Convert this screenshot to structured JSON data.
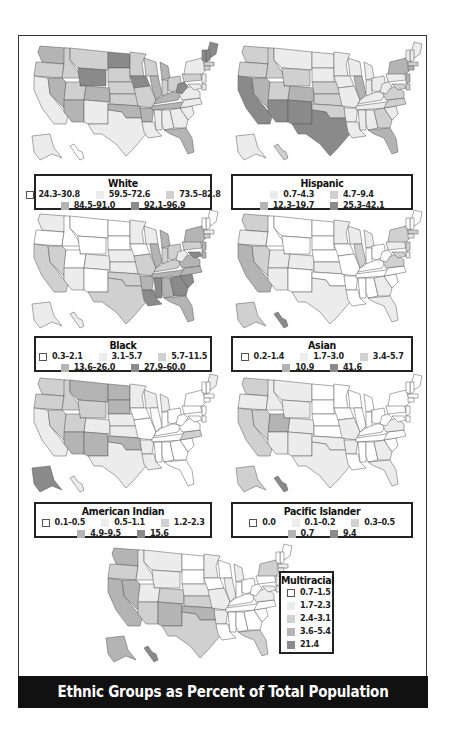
{
  "title": "Ethnic Groups as Percent of Total Population",
  "colors": {
    "c0": "#ffffff",
    "c1": "#ececec",
    "c2": "#d0d0d0",
    "c3": "#b4b4b4",
    "c4": "#8a8a8a",
    "border": "#555555"
  },
  "maps": [
    {
      "id": "white",
      "title": "White",
      "legend": [
        {
          "label": "24.3–30.8",
          "level": 0
        },
        {
          "label": "59.5–72.6",
          "level": 1
        },
        {
          "label": "73.5–82.8",
          "level": 2
        },
        {
          "label": "84.5–91.0",
          "level": 3
        },
        {
          "label": "92.1–96.9",
          "level": 4
        }
      ]
    },
    {
      "id": "hispanic",
      "title": "Hispanic",
      "legend": [
        {
          "label": "0.7–4.3",
          "level": 1
        },
        {
          "label": "4.7–9.4",
          "level": 2
        },
        {
          "label": "12.3–19.7",
          "level": 3
        },
        {
          "label": "25.3–42.1",
          "level": 4
        }
      ]
    },
    {
      "id": "black",
      "title": "Black",
      "legend": [
        {
          "label": "0.3–2.1",
          "level": 0
        },
        {
          "label": "3.1–5.7",
          "level": 1
        },
        {
          "label": "5.7–11.5",
          "level": 2
        },
        {
          "label": "13.6–26.0",
          "level": 3
        },
        {
          "label": "27.9–60.0",
          "level": 4
        }
      ]
    },
    {
      "id": "asian",
      "title": "Asian",
      "legend": [
        {
          "label": "0.2–1.4",
          "level": 0
        },
        {
          "label": "1.7–3.0",
          "level": 1
        },
        {
          "label": "3.4–5.7",
          "level": 2
        },
        {
          "label": "10.9",
          "level": 3
        },
        {
          "label": "41.6",
          "level": 4
        }
      ]
    },
    {
      "id": "american-indian",
      "title": "American Indian",
      "legend": [
        {
          "label": "0.1–0.5",
          "level": 0
        },
        {
          "label": "0.5–1.1",
          "level": 1
        },
        {
          "label": "1.2–2.3",
          "level": 2
        },
        {
          "label": "4.9–9.5",
          "level": 3
        },
        {
          "label": "15.6",
          "level": 4
        }
      ]
    },
    {
      "id": "pacific-islander",
      "title": "Pacific Islander",
      "legend": [
        {
          "label": "0.0",
          "level": 0
        },
        {
          "label": "0.1–0.2",
          "level": 1
        },
        {
          "label": "0.3–0.5",
          "level": 2
        },
        {
          "label": "0.7",
          "level": 3
        },
        {
          "label": "9.4",
          "level": 4
        }
      ]
    },
    {
      "id": "multiracial",
      "title": "Multiracial",
      "legend": [
        {
          "label": "0.7–1.5",
          "level": 0
        },
        {
          "label": "1.7–2.3",
          "level": 1
        },
        {
          "label": "2.4–3.1",
          "level": 2
        },
        {
          "label": "3.6–5.4",
          "level": 3
        },
        {
          "label": "21.4",
          "level": 4
        }
      ]
    }
  ],
  "shading": {
    "white": {
      "WA": 3,
      "OR": 2,
      "CA": 1,
      "NV": 3,
      "ID": 2,
      "MT": 2,
      "WY": 4,
      "UT": 2,
      "AZ": 3,
      "CO": 3,
      "NM": 1,
      "ND": 4,
      "SD": 2,
      "NE": 2,
      "KS": 2,
      "OK": 3,
      "TX": 1,
      "MN": 2,
      "IA": 4,
      "MO": 2,
      "AR": 3,
      "LA": 1,
      "WI": 2,
      "IL": 3,
      "MI": 3,
      "IN": 2,
      "OH": 2,
      "KY": 3,
      "TN": 3,
      "MS": 1,
      "AL": 1,
      "GA": 1,
      "FL": 3,
      "SC": 1,
      "NC": 1,
      "VA": 1,
      "WV": 4,
      "PA": 2,
      "NY": 1,
      "ME": 4,
      "NH": 4,
      "VT": 4,
      "MA": 2,
      "CT": 2,
      "NJ": 1,
      "MD": 1,
      "DE": 1,
      "AK": 1,
      "HI": 0
    },
    "hispanic": {
      "WA": 2,
      "OR": 2,
      "CA": 4,
      "NV": 3,
      "ID": 2,
      "MT": 1,
      "WY": 2,
      "UT": 2,
      "AZ": 4,
      "CO": 3,
      "NM": 4,
      "ND": 1,
      "SD": 1,
      "NE": 2,
      "KS": 2,
      "OK": 2,
      "TX": 4,
      "MN": 1,
      "IA": 1,
      "MO": 1,
      "AR": 1,
      "LA": 1,
      "WI": 1,
      "IL": 3,
      "MI": 1,
      "IN": 1,
      "OH": 1,
      "KY": 1,
      "TN": 1,
      "MS": 1,
      "AL": 1,
      "GA": 2,
      "FL": 3,
      "SC": 1,
      "NC": 2,
      "VA": 2,
      "WV": 1,
      "PA": 1,
      "NY": 3,
      "ME": 1,
      "NH": 1,
      "VT": 1,
      "MA": 2,
      "CT": 3,
      "NJ": 3,
      "MD": 2,
      "DE": 2,
      "AK": 1,
      "HI": 2
    },
    "black": {
      "WA": 1,
      "OR": 0,
      "CA": 2,
      "NV": 2,
      "ID": 0,
      "MT": 0,
      "WY": 0,
      "UT": 0,
      "AZ": 1,
      "CO": 1,
      "NM": 0,
      "ND": 0,
      "SD": 0,
      "NE": 1,
      "KS": 1,
      "OK": 2,
      "TX": 2,
      "MN": 1,
      "IA": 0,
      "MO": 2,
      "AR": 3,
      "LA": 4,
      "WI": 1,
      "IL": 3,
      "MI": 3,
      "IN": 2,
      "OH": 2,
      "KY": 2,
      "TN": 3,
      "MS": 4,
      "AL": 3,
      "GA": 4,
      "FL": 3,
      "SC": 4,
      "NC": 3,
      "VA": 3,
      "WV": 1,
      "PA": 2,
      "NY": 3,
      "ME": 0,
      "NH": 0,
      "VT": 0,
      "MA": 1,
      "CT": 2,
      "NJ": 3,
      "MD": 4,
      "DE": 3,
      "AK": 1,
      "HI": 1
    },
    "asian": {
      "WA": 2,
      "OR": 1,
      "CA": 3,
      "NV": 2,
      "ID": 0,
      "MT": 0,
      "WY": 0,
      "UT": 1,
      "AZ": 1,
      "CO": 1,
      "NM": 0,
      "ND": 0,
      "SD": 0,
      "NE": 0,
      "KS": 1,
      "OK": 0,
      "TX": 1,
      "MN": 1,
      "IA": 0,
      "MO": 0,
      "AR": 0,
      "LA": 0,
      "WI": 1,
      "IL": 2,
      "MI": 1,
      "IN": 0,
      "OH": 0,
      "KY": 0,
      "TN": 0,
      "MS": 0,
      "AL": 0,
      "GA": 1,
      "FL": 1,
      "SC": 0,
      "NC": 0,
      "VA": 2,
      "WV": 0,
      "PA": 1,
      "NY": 2,
      "ME": 0,
      "NH": 0,
      "VT": 0,
      "MA": 2,
      "CT": 1,
      "NJ": 2,
      "MD": 2,
      "DE": 1,
      "AK": 2,
      "HI": 4
    },
    "american-indian": {
      "WA": 2,
      "OR": 2,
      "CA": 1,
      "NV": 2,
      "ID": 2,
      "MT": 3,
      "WY": 2,
      "UT": 2,
      "AZ": 3,
      "CO": 1,
      "NM": 3,
      "ND": 3,
      "SD": 3,
      "NE": 1,
      "KS": 1,
      "OK": 3,
      "TX": 1,
      "MN": 1,
      "IA": 0,
      "MO": 0,
      "AR": 1,
      "LA": 1,
      "WI": 1,
      "IL": 0,
      "MI": 1,
      "IN": 0,
      "OH": 0,
      "KY": 0,
      "TN": 0,
      "MS": 0,
      "AL": 0,
      "GA": 0,
      "FL": 0,
      "SC": 0,
      "NC": 2,
      "VA": 0,
      "WV": 0,
      "PA": 0,
      "NY": 0,
      "ME": 1,
      "NH": 0,
      "VT": 0,
      "MA": 0,
      "CT": 0,
      "NJ": 0,
      "MD": 0,
      "DE": 0,
      "AK": 4,
      "HI": 1
    },
    "pacific-islander": {
      "WA": 2,
      "OR": 1,
      "CA": 2,
      "NV": 2,
      "ID": 1,
      "MT": 1,
      "WY": 1,
      "UT": 3,
      "AZ": 1,
      "CO": 1,
      "NM": 1,
      "ND": 0,
      "SD": 0,
      "NE": 0,
      "KS": 0,
      "OK": 1,
      "TX": 1,
      "MN": 0,
      "IA": 0,
      "MO": 1,
      "AR": 1,
      "LA": 0,
      "WI": 0,
      "IL": 0,
      "MI": 0,
      "IN": 0,
      "OH": 0,
      "KY": 0,
      "TN": 0,
      "MS": 0,
      "AL": 0,
      "GA": 1,
      "FL": 1,
      "SC": 0,
      "NC": 0,
      "VA": 1,
      "WV": 0,
      "PA": 0,
      "NY": 0,
      "ME": 0,
      "NH": 0,
      "VT": 0,
      "MA": 0,
      "CT": 0,
      "NJ": 0,
      "MD": 0,
      "DE": 0,
      "AK": 2,
      "HI": 4
    },
    "multiracial": {
      "WA": 3,
      "OR": 2,
      "CA": 3,
      "NV": 3,
      "ID": 1,
      "MT": 1,
      "WY": 1,
      "UT": 1,
      "AZ": 2,
      "CO": 2,
      "NM": 3,
      "ND": 0,
      "SD": 0,
      "NE": 1,
      "KS": 2,
      "OK": 3,
      "TX": 2,
      "MN": 1,
      "IA": 0,
      "MO": 1,
      "AR": 1,
      "LA": 0,
      "WI": 0,
      "IL": 1,
      "MI": 1,
      "IN": 0,
      "OH": 0,
      "KY": 0,
      "TN": 0,
      "MS": 0,
      "AL": 0,
      "GA": 0,
      "FL": 2,
      "SC": 0,
      "NC": 0,
      "VA": 1,
      "WV": 0,
      "PA": 0,
      "NY": 2,
      "ME": 0,
      "NH": 0,
      "VT": 0,
      "MA": 1,
      "CT": 1,
      "NJ": 1,
      "MD": 1,
      "DE": 1,
      "AK": 3,
      "HI": 4
    }
  }
}
